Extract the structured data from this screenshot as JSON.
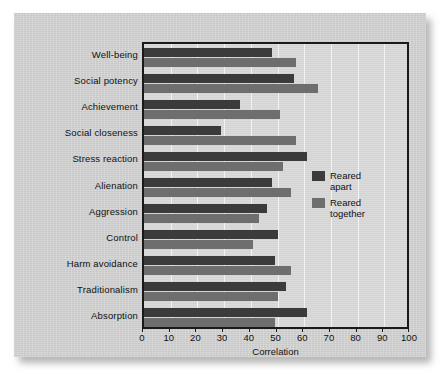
{
  "chart_data": {
    "type": "bar",
    "orientation": "horizontal",
    "title": "",
    "xlabel": "Correlation",
    "ylabel": "",
    "xlim": [
      0,
      100
    ],
    "xticks": [
      0,
      10,
      20,
      30,
      40,
      50,
      60,
      70,
      80,
      90,
      100
    ],
    "grid": true,
    "legend_position": "right-middle",
    "categories": [
      "Well-being",
      "Social potency",
      "Achievement",
      "Social closeness",
      "Stress reaction",
      "Alienation",
      "Aggression",
      "Control",
      "Harm avoidance",
      "Traditionalism",
      "Absorption"
    ],
    "series": [
      {
        "name": "Reared apart",
        "color": "#3b3b3b",
        "values": [
          48,
          56,
          36,
          29,
          61,
          48,
          46,
          50,
          49,
          53,
          61
        ]
      },
      {
        "name": "Reared together",
        "color": "#6e6e6e",
        "values": [
          57,
          65,
          51,
          57,
          52,
          55,
          43,
          41,
          55,
          50,
          49
        ]
      }
    ]
  },
  "legend": {
    "items": [
      {
        "label": "Reared\napart",
        "swatch": "apart"
      },
      {
        "label": "Reared\ntogether",
        "swatch": "together"
      }
    ]
  },
  "colors": {
    "reared_apart": "#3b3b3b",
    "reared_together": "#6e6e6e",
    "card_background": "#d0d0d0",
    "plot_background": "#d7d7d7",
    "gridline": "#f2f2f2",
    "axis": "#1a1a1a",
    "text": "#111111"
  }
}
